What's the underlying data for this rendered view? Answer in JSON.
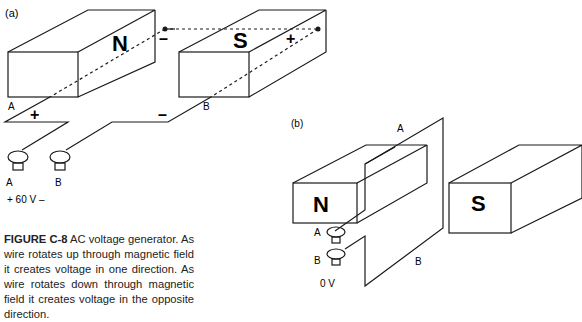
{
  "figure": {
    "panel_a": {
      "label": "(a)",
      "magnet_left": "N",
      "magnet_right": "S",
      "polarity_n_top": "–",
      "polarity_s_top": "+",
      "wire_end_a": "A",
      "wire_end_b": "B",
      "polarity_a": "+",
      "polarity_b": "–",
      "terminal_a": "A",
      "terminal_b": "B",
      "voltage": "+ 60 V –"
    },
    "panel_b": {
      "label": "(b)",
      "magnet_left": "N",
      "magnet_right": "S",
      "wire_a": "A",
      "wire_b": "B",
      "terminal_a": "A",
      "terminal_b": "B",
      "voltage": "0 V"
    },
    "caption": {
      "id": "FIGURE C-8",
      "text": "AC voltage generator. As wire rotates up through magnetic field it creates voltage in one direction. As wire rotates down through magnetic field it creates voltage in the opposite direction."
    }
  }
}
